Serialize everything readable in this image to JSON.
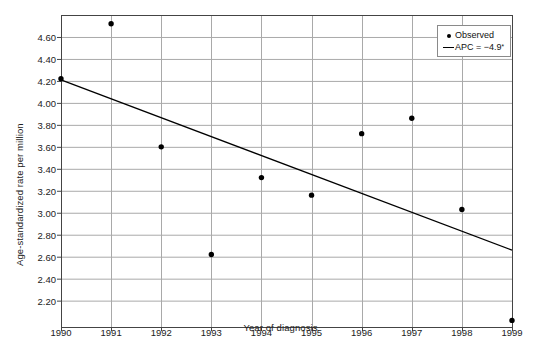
{
  "chart_data": {
    "type": "scatter",
    "title": "",
    "xlabel": "Year of diagnosis",
    "ylabel": "Age-standardized rate per million",
    "x": [
      1990,
      1991,
      1992,
      1993,
      1994,
      1995,
      1996,
      1997,
      1998,
      1999
    ],
    "xticklabels": [
      "1990",
      "1991",
      "1992",
      "1993",
      "1994",
      "1995",
      "1996",
      "1997",
      "1998",
      "1999"
    ],
    "xlim": [
      1990,
      1999
    ],
    "ylim": [
      1.96,
      4.8
    ],
    "yticks": [
      2.2,
      2.4,
      2.6,
      2.8,
      3.0,
      3.2,
      3.4,
      3.6,
      3.8,
      4.0,
      4.2,
      4.4,
      4.6
    ],
    "yticklabels": [
      "2.20",
      "2.40",
      "2.60",
      "2.80",
      "3.00",
      "3.20",
      "3.40",
      "3.60",
      "3.80",
      "4.00",
      "4.20",
      "4.40",
      "4.60"
    ],
    "grid": true,
    "series": [
      {
        "name": "Observed",
        "kind": "points",
        "values": [
          4.22,
          4.72,
          3.6,
          2.62,
          3.32,
          3.16,
          3.72,
          3.86,
          3.03,
          2.02
        ]
      },
      {
        "name": "APC = −4.9",
        "kind": "line",
        "endpoints": [
          {
            "x": 1990,
            "y": 4.21
          },
          {
            "x": 1999,
            "y": 2.66
          }
        ]
      }
    ],
    "legend_position": "top-right"
  },
  "legend": {
    "entries": [
      {
        "marker": "point-marker",
        "label": "Observed",
        "sup": ""
      },
      {
        "marker": "line-marker",
        "label": "APC = −4.9",
        "sup": "*"
      }
    ]
  },
  "axes": {
    "y_title": "Age-standardized rate per million",
    "x_title": "Year of diagnosis"
  }
}
